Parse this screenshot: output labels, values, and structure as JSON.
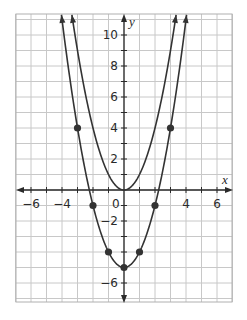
{
  "chart_data": {
    "type": "line",
    "title": "",
    "xlabel": "x",
    "ylabel": "y",
    "xlim": [
      -7,
      7
    ],
    "ylim": [
      -7.2,
      11.35
    ],
    "grid": true,
    "grid_step": 1,
    "x_tick_labels": [
      {
        "value": -6,
        "label": "−6"
      },
      {
        "value": -4,
        "label": "−4"
      },
      {
        "value": 4,
        "label": "4"
      },
      {
        "value": 6,
        "label": "6"
      }
    ],
    "origin_label": "0",
    "y_tick_labels": [
      {
        "value": 10,
        "label": "10"
      },
      {
        "value": 8,
        "label": "8"
      },
      {
        "value": 6,
        "label": "6"
      },
      {
        "value": 4,
        "label": "4"
      },
      {
        "value": 2,
        "label": "2"
      },
      {
        "value": -2,
        "label": "−2"
      },
      {
        "value": -6,
        "label": "−6"
      }
    ],
    "series": [
      {
        "name": "y = x^2",
        "a": 1,
        "c": 0,
        "points": [],
        "arrows": true
      },
      {
        "name": "y = x^2 - 5",
        "a": 1,
        "c": -5,
        "points": [
          [
            -3,
            4
          ],
          [
            -2,
            -1
          ],
          [
            -1,
            -4
          ],
          [
            0,
            -5
          ],
          [
            1,
            -4
          ],
          [
            2,
            -1
          ],
          [
            3,
            4
          ]
        ],
        "arrows": true
      }
    ],
    "colors": {
      "grid": "#c8c8c8",
      "border": "#b0b0b0",
      "axis": "#2a2a2a",
      "curve": "#333333",
      "point": "#333333"
    }
  }
}
